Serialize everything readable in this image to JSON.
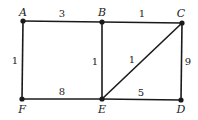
{
  "diagram": {
    "type": "weighted-undirected-graph",
    "nodes": [
      {
        "id": "A",
        "label": "A",
        "x": 23,
        "y": 21,
        "lx": 23,
        "ly": 16
      },
      {
        "id": "B",
        "label": "B",
        "x": 102,
        "y": 22,
        "lx": 102,
        "ly": 16
      },
      {
        "id": "C",
        "label": "C",
        "x": 182,
        "y": 23,
        "lx": 181,
        "ly": 17
      },
      {
        "id": "F",
        "label": "F",
        "x": 22,
        "y": 99,
        "lx": 22,
        "ly": 113
      },
      {
        "id": "E",
        "label": "E",
        "x": 102,
        "y": 99,
        "lx": 102,
        "ly": 113
      },
      {
        "id": "D",
        "label": "D",
        "x": 181,
        "y": 100,
        "lx": 181,
        "ly": 113
      }
    ],
    "edges": [
      {
        "from": "A",
        "to": "B",
        "weight": "1",
        "w": "3",
        "lx": 62,
        "ly": 17
      },
      {
        "from": "B",
        "to": "C",
        "w": "1",
        "lx": 142,
        "ly": 17
      },
      {
        "from": "A",
        "to": "F",
        "w": "1",
        "lx": 15,
        "ly": 64
      },
      {
        "from": "B",
        "to": "E",
        "w": "1",
        "lx": 95,
        "ly": 65
      },
      {
        "from": "E",
        "to": "C",
        "w": "1",
        "lx": 132,
        "ly": 63
      },
      {
        "from": "C",
        "to": "D",
        "w": "9",
        "lx": 188,
        "ly": 65
      },
      {
        "from": "F",
        "to": "E",
        "w": "8",
        "lx": 62,
        "ly": 95
      },
      {
        "from": "E",
        "to": "D",
        "w": "5",
        "lx": 141,
        "ly": 96
      }
    ]
  }
}
